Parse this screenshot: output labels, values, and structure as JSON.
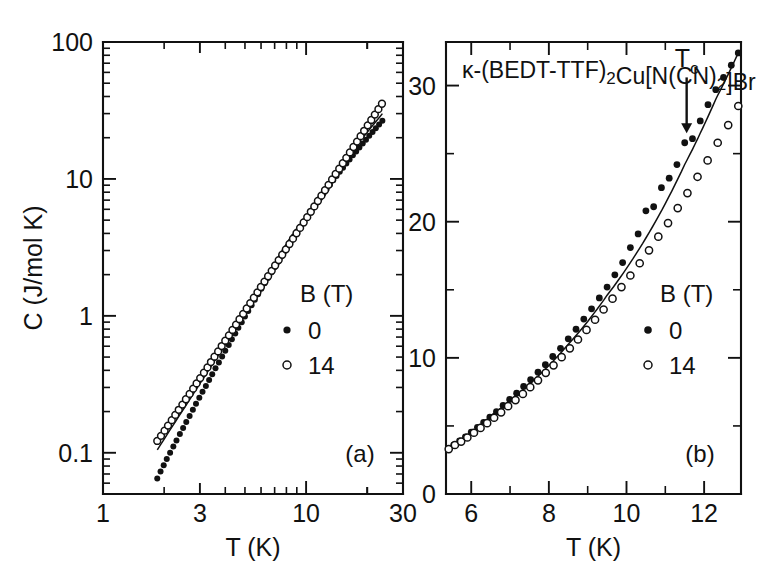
{
  "figure": {
    "background_color": "#ffffff",
    "ink_color": "#111111",
    "width": 779,
    "height": 574
  },
  "chart_data": [
    {
      "type": "scatter",
      "panel_tag": "(a)",
      "title": "",
      "xlabel": "T (K)",
      "ylabel": "C (J/mol K)",
      "xscale": "log",
      "yscale": "log",
      "xlim": [
        1,
        30
      ],
      "ylim": [
        0.05,
        100
      ],
      "xticks": [
        1,
        3,
        10,
        30
      ],
      "xticklabels": [
        "1",
        "3",
        "10",
        "30"
      ],
      "yticks": [
        0.1,
        1,
        10,
        100
      ],
      "yticklabels": [
        "0.1",
        "1",
        "10",
        "100"
      ],
      "grid": false,
      "legend": {
        "title": "B (T)",
        "position": "center-right",
        "entries": [
          {
            "label": "0",
            "marker": "filled-circle"
          },
          {
            "label": "14",
            "marker": "open-circle"
          }
        ]
      },
      "series": [
        {
          "name": "0",
          "marker": "filled-circle",
          "x": [
            1.85,
            1.92,
            1.99,
            2.06,
            2.14,
            2.22,
            2.3,
            2.39,
            2.48,
            2.57,
            2.67,
            2.77,
            2.87,
            2.98,
            3.09,
            3.21,
            3.33,
            3.45,
            3.58,
            3.72,
            3.86,
            4.0,
            4.16,
            4.31,
            4.48,
            4.64,
            4.82,
            5.0,
            5.19,
            5.39,
            5.59,
            5.8,
            6.02,
            6.25,
            6.48,
            6.73,
            6.98,
            7.25,
            7.52,
            7.8,
            8.1,
            8.4,
            8.72,
            9.05,
            9.39,
            9.75,
            10.11,
            10.5,
            10.89,
            11.3,
            11.73,
            12.17,
            12.63,
            13.11,
            13.6,
            14.12,
            14.65,
            15.2,
            15.78,
            16.37,
            16.99,
            17.64,
            18.3,
            19.0,
            19.72,
            20.46,
            21.24,
            22.04,
            22.88,
            23.74
          ],
          "y": [
            0.065,
            0.073,
            0.081,
            0.09,
            0.1,
            0.111,
            0.123,
            0.137,
            0.152,
            0.168,
            0.186,
            0.206,
            0.228,
            0.252,
            0.279,
            0.308,
            0.34,
            0.375,
            0.414,
            0.457,
            0.504,
            0.555,
            0.612,
            0.674,
            0.742,
            0.817,
            0.899,
            0.988,
            1.086,
            1.193,
            1.31,
            1.437,
            1.576,
            1.727,
            1.891,
            2.07,
            2.264,
            2.474,
            2.702,
            2.948,
            3.214,
            3.501,
            3.81,
            4.143,
            4.5,
            4.884,
            5.295,
            5.736,
            6.207,
            6.711,
            7.248,
            7.82,
            8.43,
            9.08,
            9.77,
            10.5,
            11.27,
            12.09,
            12.96,
            13.88,
            14.86,
            15.89,
            16.98,
            18.14,
            19.36,
            20.65,
            22.02,
            23.47,
            25.0,
            26.6
          ]
        },
        {
          "name": "14",
          "marker": "open-circle",
          "x": [
            1.85,
            1.93,
            2.01,
            2.09,
            2.18,
            2.27,
            2.36,
            2.46,
            2.56,
            2.67,
            2.78,
            2.89,
            3.01,
            3.14,
            3.27,
            3.4,
            3.54,
            3.69,
            3.84,
            4.0,
            4.17,
            4.34,
            4.52,
            4.7,
            4.9,
            5.1,
            5.31,
            5.53,
            5.76,
            5.99,
            6.24,
            6.5,
            6.77,
            7.04,
            7.33,
            7.63,
            7.95,
            8.28,
            8.62,
            8.97,
            9.34,
            9.73,
            10.13,
            10.55,
            10.98,
            11.43,
            11.9,
            12.39,
            12.9,
            13.43,
            13.98,
            14.56,
            15.16,
            15.78,
            16.43,
            17.11,
            17.82,
            18.55,
            19.31,
            20.11,
            20.94,
            21.8,
            22.7,
            23.63
          ],
          "y": [
            0.122,
            0.133,
            0.145,
            0.158,
            0.173,
            0.189,
            0.206,
            0.225,
            0.246,
            0.269,
            0.294,
            0.321,
            0.351,
            0.384,
            0.42,
            0.46,
            0.503,
            0.55,
            0.602,
            0.659,
            0.721,
            0.789,
            0.863,
            0.945,
            1.034,
            1.132,
            1.239,
            1.356,
            1.485,
            1.625,
            1.779,
            1.947,
            2.132,
            2.333,
            2.554,
            2.795,
            3.059,
            3.348,
            3.664,
            4.01,
            4.389,
            4.804,
            5.258,
            5.755,
            6.3,
            6.897,
            7.551,
            8.268,
            9.053,
            9.914,
            10.86,
            11.89,
            13.02,
            14.26,
            15.62,
            17.11,
            18.74,
            20.52,
            22.47,
            24.61,
            26.95,
            29.52,
            32.33,
            35.41
          ]
        }
      ],
      "fit_line": {
        "description": "smooth line through data",
        "x": [
          1.85,
          3,
          6,
          10,
          16,
          23.74
        ],
        "y": [
          0.105,
          0.32,
          1.57,
          5.25,
          14.6,
          30.0
        ]
      }
    },
    {
      "type": "scatter",
      "panel_tag": "(b)",
      "title": "κ-(BEDT-TTF)₂Cu[N(CN)₂]Br",
      "title_parts": [
        {
          "text": "κ-(BEDT-TTF)",
          "sub": false
        },
        {
          "text": "2",
          "sub": true
        },
        {
          "text": "Cu[N(CN)",
          "sub": false
        },
        {
          "text": "2",
          "sub": true
        },
        {
          "text": "]Br",
          "sub": false
        }
      ],
      "xlabel": "T (K)",
      "ylabel": "",
      "xscale": "linear",
      "yscale": "linear",
      "xlim": [
        5.35,
        12.95
      ],
      "ylim": [
        0,
        33.2
      ],
      "xticks": [
        6,
        8,
        10,
        12
      ],
      "xticklabels": [
        "6",
        "8",
        "10",
        "12"
      ],
      "xticks_minor": [
        7,
        9,
        11
      ],
      "yticks": [
        0,
        10,
        20,
        30
      ],
      "yticklabels": [
        "0",
        "10",
        "20",
        "30"
      ],
      "yticks_minor": [
        5,
        15,
        25
      ],
      "grid": false,
      "annotation": {
        "label": "T_c",
        "label_text": "T",
        "label_sub": "c",
        "arrow_x": 11.55,
        "arrow_y_top": 30.6,
        "arrow_y_tip": 26.5
      },
      "legend": {
        "title": "B (T)",
        "position": "lower-right",
        "entries": [
          {
            "label": "0",
            "marker": "filled-circle"
          },
          {
            "label": "14",
            "marker": "open-circle"
          }
        ]
      },
      "series": [
        {
          "name": "0",
          "marker": "filled-circle",
          "x": [
            5.42,
            5.55,
            5.7,
            5.85,
            6.0,
            6.16,
            6.32,
            6.48,
            6.65,
            6.82,
            6.99,
            7.17,
            7.35,
            7.53,
            7.72,
            7.91,
            8.1,
            8.3,
            8.5,
            8.7,
            8.9,
            9.1,
            9.3,
            9.5,
            9.7,
            9.9,
            10.1,
            10.3,
            10.5,
            10.7,
            10.9,
            11.1,
            11.3,
            11.5,
            11.7,
            11.9,
            12.1,
            12.3,
            12.5,
            12.7,
            12.88
          ],
          "y": [
            3.35,
            3.6,
            3.9,
            4.2,
            4.55,
            4.9,
            5.25,
            5.65,
            6.05,
            6.5,
            6.95,
            7.4,
            7.9,
            8.4,
            8.95,
            9.5,
            10.1,
            10.7,
            11.4,
            12.1,
            12.85,
            13.6,
            14.4,
            15.2,
            16.1,
            17.0,
            18.1,
            19.1,
            20.8,
            21.1,
            22.5,
            23.2,
            24.2,
            25.8,
            26.1,
            27.4,
            28.6,
            29.7,
            30.6,
            31.5,
            32.4
          ]
        },
        {
          "name": "14",
          "marker": "open-circle",
          "x": [
            5.42,
            5.58,
            5.74,
            5.9,
            6.07,
            6.24,
            6.41,
            6.59,
            6.77,
            6.95,
            7.14,
            7.33,
            7.52,
            7.72,
            7.92,
            8.12,
            8.33,
            8.54,
            8.75,
            8.97,
            9.19,
            9.41,
            9.64,
            9.87,
            10.1,
            10.34,
            10.58,
            10.82,
            11.07,
            11.32,
            11.57,
            11.83,
            12.09,
            12.35,
            12.62,
            12.88
          ],
          "y": [
            3.3,
            3.6,
            3.85,
            4.15,
            4.5,
            4.85,
            5.2,
            5.6,
            6.0,
            6.45,
            6.9,
            7.35,
            7.85,
            8.35,
            8.9,
            9.45,
            10.05,
            10.7,
            11.35,
            12.05,
            12.8,
            13.55,
            14.35,
            15.2,
            16.05,
            16.95,
            17.9,
            18.9,
            19.9,
            21.0,
            22.1,
            23.3,
            24.5,
            25.8,
            27.1,
            28.5
          ]
        }
      ],
      "fit_line": {
        "description": "smooth line through data",
        "x": [
          5.42,
          6.5,
          7.5,
          8.5,
          9.5,
          10.5,
          11.5,
          12.3,
          12.88
        ],
        "y": [
          3.3,
          5.75,
          8.1,
          11.0,
          14.6,
          18.8,
          24.2,
          29.0,
          32.4
        ]
      }
    }
  ]
}
